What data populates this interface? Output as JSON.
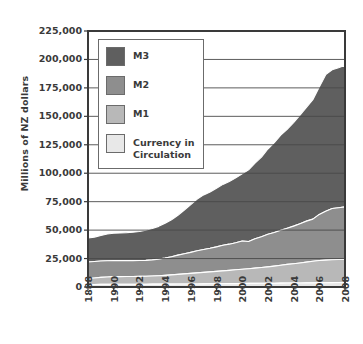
{
  "chart_data": {
    "type": "area",
    "title": "",
    "subtitle": "",
    "xlabel": "",
    "ylabel": "Millions of NZ dollars",
    "stacked": true,
    "grid": true,
    "legend_position": "upper-left-inside",
    "ylim": [
      0,
      225000
    ],
    "xlim": [
      1988,
      2008
    ],
    "ytick_labels": [
      "225,000",
      "200,000",
      "175,000",
      "150,000",
      "125,000",
      "100,000",
      "75,000",
      "50,000",
      "25,000",
      "0"
    ],
    "ytick_values": [
      225000,
      200000,
      175000,
      150000,
      125000,
      100000,
      75000,
      50000,
      25000,
      0
    ],
    "xtick_labels": [
      "1888",
      "1990",
      "1992",
      "1994",
      "1996",
      "1998",
      "2000",
      "2002",
      "2004",
      "2006",
      "2008"
    ],
    "xtick_values": [
      1988,
      1990,
      1992,
      1994,
      1996,
      1998,
      2000,
      2002,
      2004,
      2006,
      2008
    ],
    "x": [
      1988,
      1988.5,
      1989,
      1989.5,
      1990,
      1990.5,
      1991,
      1991.5,
      1992,
      1992.5,
      1993,
      1993.5,
      1994,
      1994.5,
      1995,
      1995.5,
      1996,
      1996.5,
      1997,
      1997.5,
      1998,
      1998.5,
      1999,
      1999.5,
      2000,
      2000.5,
      2001,
      2001.5,
      2002,
      2002.5,
      2003,
      2003.5,
      2004,
      2004.5,
      2005,
      2005.5,
      2006,
      2006.5,
      2007,
      2007.5,
      2008
    ],
    "series": [
      {
        "name": "Currency in Circulation",
        "color": "#e8e8e8",
        "values": [
          2200,
          2250,
          2300,
          2350,
          2400,
          2400,
          2400,
          2400,
          2450,
          2450,
          2500,
          2500,
          2550,
          2550,
          2600,
          2600,
          2650,
          2700,
          2750,
          2800,
          2850,
          2900,
          2950,
          3000,
          3100,
          3150,
          3200,
          3250,
          3300,
          3350,
          3400,
          3450,
          3500,
          3550,
          3600,
          3650,
          3700,
          3750,
          3850,
          3950,
          4100
        ]
      },
      {
        "name": "M1",
        "color": "#b8b8b8",
        "values": [
          5300,
          5700,
          6200,
          6500,
          6700,
          6750,
          6800,
          6850,
          6900,
          7000,
          7150,
          7400,
          7700,
          8100,
          8500,
          8900,
          9300,
          9700,
          10100,
          10500,
          10900,
          11300,
          11700,
          12100,
          12500,
          12900,
          13400,
          13900,
          14400,
          15000,
          15700,
          16400,
          17000,
          17600,
          18300,
          19000,
          19600,
          19900,
          20100,
          20200,
          20300
        ]
      },
      {
        "name": "M2",
        "color": "#8e8e8e",
        "values": [
          14500,
          14400,
          14300,
          14200,
          14100,
          14050,
          14000,
          13950,
          13900,
          13950,
          14200,
          14600,
          15200,
          16000,
          16900,
          17700,
          18500,
          19400,
          20100,
          20700,
          21500,
          22500,
          23000,
          23800,
          24800,
          24000,
          25800,
          27000,
          28600,
          29500,
          30800,
          31800,
          33000,
          34500,
          36000,
          37000,
          40500,
          43000,
          45000,
          45500,
          46000
        ]
      },
      {
        "name": "M3",
        "color": "#5f5f5f",
        "values": [
          21000,
          21500,
          22500,
          23500,
          24000,
          24200,
          24500,
          25000,
          25500,
          26500,
          27500,
          28800,
          30500,
          32500,
          35000,
          38500,
          42000,
          45500,
          48000,
          49500,
          51500,
          53500,
          55000,
          57000,
          59000,
          63000,
          66500,
          70000,
          75000,
          79000,
          83500,
          87000,
          91000,
          95500,
          100000,
          105000,
          112000,
          120000,
          122000,
          123000,
          124600
        ]
      }
    ],
    "stack_tops": {
      "description": "cumulative top of each band, millions NZD",
      "currency_top_2008": 4100,
      "m1_top_2008": 24400,
      "m2_top_2008": 70400,
      "m3_top_2008": 195000,
      "m3_top_1988": 43000
    }
  },
  "legend": {
    "items": [
      {
        "label": "M3",
        "color": "#5f5f5f"
      },
      {
        "label": "M2",
        "color": "#8e8e8e"
      },
      {
        "label": "M1",
        "color": "#b8b8b8"
      },
      {
        "label": "Currency in\nCirculation",
        "color": "#e8e8e8"
      }
    ]
  },
  "axes": {
    "y_title": "Millions of NZ dollars",
    "frame_color": "#3a3a3a",
    "gridline_color": "#4a4a4a",
    "plot_background": "#ffffff"
  }
}
